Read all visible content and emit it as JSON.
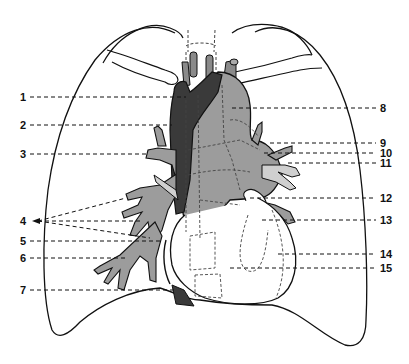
{
  "diagram": {
    "colors": {
      "outline": "#111111",
      "dark_structure": "#3a3a3a",
      "mid_gray_structure": "#9a9a9a",
      "light_gray_structure": "#c4c4c4",
      "background": "#ffffff"
    },
    "labels_left": [
      {
        "id": "1",
        "text": "1",
        "y": 97
      },
      {
        "id": "2",
        "text": "2",
        "y": 125
      },
      {
        "id": "3",
        "text": "3",
        "y": 154
      },
      {
        "id": "4",
        "text": "4",
        "y": 221
      },
      {
        "id": "5",
        "text": "5",
        "y": 241
      },
      {
        "id": "6",
        "text": "6",
        "y": 258
      },
      {
        "id": "7",
        "text": "7",
        "y": 290
      }
    ],
    "labels_right": [
      {
        "id": "8",
        "text": "8",
        "y": 108
      },
      {
        "id": "9",
        "text": "9",
        "y": 143
      },
      {
        "id": "10",
        "text": "10",
        "y": 153
      },
      {
        "id": "11",
        "text": "11",
        "y": 163
      },
      {
        "id": "12",
        "text": "12",
        "y": 198
      },
      {
        "id": "13",
        "text": "13",
        "y": 220
      },
      {
        "id": "14",
        "text": "14",
        "y": 254
      },
      {
        "id": "15",
        "text": "15",
        "y": 268
      }
    ]
  }
}
